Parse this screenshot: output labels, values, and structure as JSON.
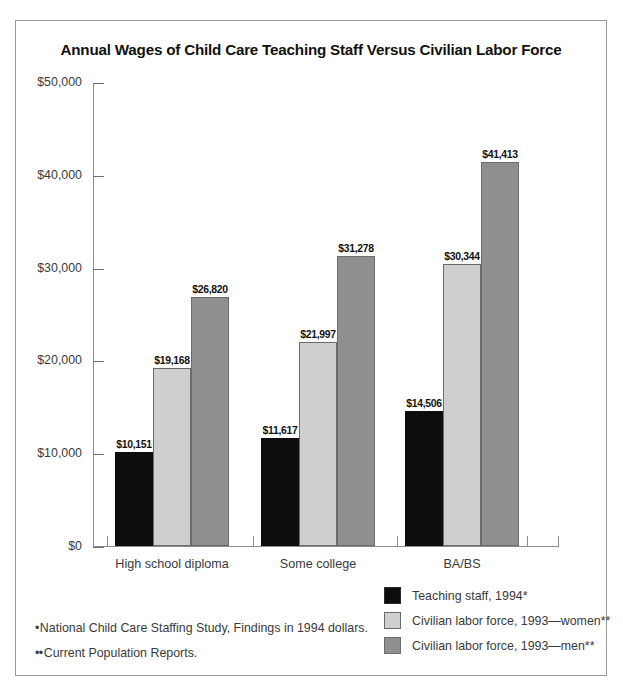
{
  "chart_data": {
    "type": "bar",
    "title": "Annual Wages of Child Care Teaching Staff Versus Civilian Labor Force",
    "xlabel": "",
    "ylabel": "",
    "categories": [
      "High school diploma",
      "Some college",
      "BA/BS"
    ],
    "series": [
      {
        "name": "Teaching staff, 1994*",
        "color": "#0d0d0d",
        "values": [
          10151,
          11617,
          14506
        ],
        "labels": [
          "$10,151",
          "$11,617",
          "$14,506"
        ]
      },
      {
        "name": "Civilian labor force, 1993—women**",
        "color": "#cfcfcf",
        "values": [
          19168,
          21997,
          30344
        ],
        "labels": [
          "$19,168",
          "$21,997",
          "$30,344"
        ]
      },
      {
        "name": "Civilian labor force, 1993—men**",
        "color": "#8f8f8f",
        "values": [
          26820,
          31278,
          41413
        ],
        "labels": [
          "$26,820",
          "$31,278",
          "$41,413"
        ]
      }
    ],
    "ylim": [
      0,
      50000
    ],
    "yticks": [
      0,
      10000,
      20000,
      30000,
      40000,
      50000
    ],
    "ytick_labels": [
      "$0",
      "$10,000",
      "$20,000",
      "$30,000",
      "$40,000",
      "$50,000"
    ],
    "grid": false,
    "legend_position": "bottom-right"
  },
  "footnotes": [
    {
      "marker": "•",
      "text": "National Child Care Staffing Study, Findings in 1994 dollars."
    },
    {
      "marker": "••",
      "text": "Current Population Reports."
    }
  ]
}
